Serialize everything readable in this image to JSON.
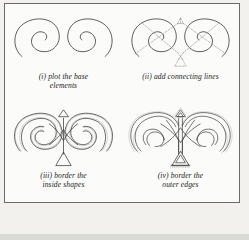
{
  "figure": {
    "border_color": "#6b6b6b",
    "paper_color": "#fbfbf9",
    "page_color": "#f2f1ee",
    "ink_color": "#3a3a3a",
    "dash_color": "#9a9a9a",
    "band_color": "#d9d9d6"
  },
  "panels": [
    {
      "id": "panel-i",
      "label": "(i)",
      "caption_lines": [
        "(i) plot the base",
        "elements"
      ],
      "caption_full": "(i) plot the base elements",
      "art_name": "two-mirrored-spirals",
      "description": "two mirrored open spirals drawn as thin solid lines"
    },
    {
      "id": "panel-ii",
      "label": "(ii)",
      "caption_lines": [
        "(ii) add connecting lines"
      ],
      "caption_full": "(ii) add connecting lines",
      "art_name": "spirals-with-dashed-connectors",
      "description": "the two spirals overlaid with dashed construction lines crossing in an X through each spiral and forming small triangles above and below centre"
    },
    {
      "id": "panel-iii",
      "label": "(iii)",
      "caption_lines": [
        "(iii) border the",
        "inside shapes"
      ],
      "caption_full": "(iii) border the inside shapes",
      "art_name": "inside-shapes-bordered",
      "description": "the connected figure with the inner shapes outlined and shaded with dotted bands, triangles at top and bottom centre"
    },
    {
      "id": "panel-iv",
      "label": "(iv)",
      "caption_lines": [
        "(iv) border the",
        "outer edges"
      ],
      "caption_full": "(iv) border the outer edges",
      "art_name": "outer-edges-bordered",
      "description": "the finished interlaced knot with every band doubled and the outer edges bordered with fine dotted lines"
    }
  ]
}
